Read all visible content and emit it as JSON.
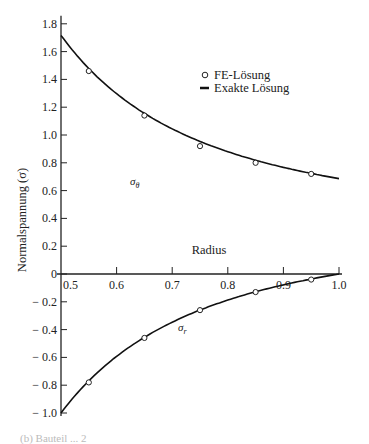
{
  "chart_data": {
    "type": "line",
    "title": "",
    "xlabel": "Radius",
    "ylabel": "Normalspannung (σ)",
    "xlim": [
      0.5,
      1.0
    ],
    "ylim": [
      -1.0,
      1.8
    ],
    "x_ticks": [
      "0.5",
      "0.6",
      "0.7",
      "0.8",
      "0.9",
      "1.0"
    ],
    "y_ticks": [
      "1.8",
      "1.6",
      "1.4",
      "1.2",
      "1.0",
      "0.8",
      "0.6",
      "0.4",
      "0.2",
      "0",
      "− 0.2",
      "− 0.4",
      "− 0.6",
      "− 0.8",
      "− 1.0"
    ],
    "grid": false,
    "legend_position": "upper right",
    "legend": [
      {
        "marker": "circle",
        "label": "FE-Lösung"
      },
      {
        "marker": "line",
        "label": "Exakte Lösung"
      }
    ],
    "series": [
      {
        "name": "σθ exakt",
        "style": "line",
        "x": [
          0.5,
          0.55,
          0.6,
          0.65,
          0.7,
          0.75,
          0.8,
          0.85,
          0.9,
          0.95,
          1.0
        ],
        "values": [
          1.72,
          1.46,
          1.26,
          1.14,
          1.03,
          0.93,
          0.85,
          0.79,
          0.75,
          0.71,
          0.68
        ]
      },
      {
        "name": "σθ FE",
        "style": "circle",
        "x": [
          0.55,
          0.65,
          0.75,
          0.85,
          0.95
        ],
        "values": [
          1.46,
          1.14,
          0.92,
          0.8,
          0.72
        ]
      },
      {
        "name": "σr exakt",
        "style": "line",
        "x": [
          0.5,
          0.55,
          0.6,
          0.65,
          0.7,
          0.75,
          0.8,
          0.85,
          0.9,
          0.95,
          1.0
        ],
        "values": [
          -1.0,
          -0.78,
          -0.59,
          -0.46,
          -0.35,
          -0.26,
          -0.19,
          -0.13,
          -0.08,
          -0.04,
          0.0
        ]
      },
      {
        "name": "σr FE",
        "style": "circle",
        "x": [
          0.55,
          0.65,
          0.75,
          0.85,
          0.95
        ],
        "values": [
          -0.78,
          -0.46,
          -0.26,
          -0.13,
          -0.04
        ]
      }
    ],
    "annotations": [
      {
        "text": "σθ",
        "x": 0.725,
        "y": 1.0
      },
      {
        "text": "σr",
        "x": 0.725,
        "y": -0.33
      }
    ]
  },
  "labels": {
    "xlabel": "Radius",
    "ylabel": "Normalspannung (σ)",
    "legend_fe": "FE-Lösung",
    "legend_exact": "Exakte Lösung",
    "annot_theta": "σ",
    "annot_theta_sub": "θ",
    "annot_r": "σ",
    "annot_r_sub": "r",
    "caption": "(b)  Bauteil ...  2"
  }
}
